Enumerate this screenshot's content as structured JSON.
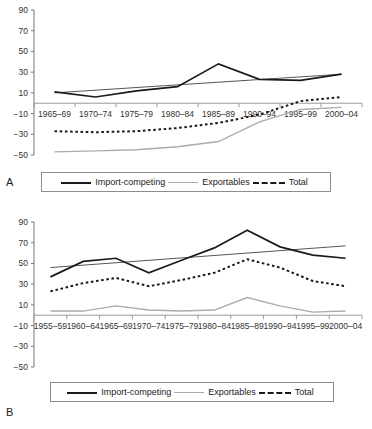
{
  "figure": {
    "panels": [
      {
        "letter": "A",
        "legend": [
          {
            "label": "Import-competing",
            "style": "solid-dark",
            "color": "#1a1a1a"
          },
          {
            "label": "Exportables",
            "style": "solid-light",
            "color": "#a8a8a8"
          },
          {
            "label": "Total",
            "style": "dotted",
            "color": "#1a1a1a"
          }
        ]
      },
      {
        "letter": "B",
        "legend": [
          {
            "label": "Import-competing",
            "style": "solid-dark",
            "color": "#1a1a1a"
          },
          {
            "label": "Exportables",
            "style": "solid-light",
            "color": "#a8a8a8"
          },
          {
            "label": "Total",
            "style": "dotted",
            "color": "#1a1a1a"
          }
        ]
      }
    ]
  },
  "chart_data": [
    {
      "type": "line",
      "panel": "A",
      "title": "",
      "xlabel": "",
      "ylabel": "",
      "ylim": [
        -50,
        90
      ],
      "yticks": [
        90,
        70,
        50,
        30,
        10,
        -10,
        -30,
        -50
      ],
      "ytick_labels": [
        "90",
        "70",
        "50",
        "30",
        "10",
        "−10",
        "−30",
        "−50"
      ],
      "grid": false,
      "legend_position": "bottom",
      "categories": [
        "1965–69",
        "1970–74",
        "1975–79",
        "1980–84",
        "1985–89",
        "1990–94",
        "1995–99",
        "2000–04"
      ],
      "series": [
        {
          "name": "Import-competing",
          "style": "solid-dark",
          "color": "#1a1a1a",
          "values": [
            11,
            6,
            12,
            16,
            38,
            23,
            22,
            28
          ]
        },
        {
          "name": "Exportables",
          "style": "solid-light",
          "color": "#a8a8a8",
          "values": [
            -47,
            -46,
            -45,
            -42,
            -37,
            -18,
            -6,
            -4
          ]
        },
        {
          "name": "Total",
          "style": "dotted",
          "color": "#1a1a1a",
          "values": [
            -27,
            -28,
            -27,
            -24,
            -19,
            -11,
            2,
            6
          ]
        }
      ],
      "trend_lines": [
        {
          "name": "Import-competing trend",
          "color": "#555555",
          "from": [
            0,
            10
          ],
          "to": [
            7,
            28
          ]
        }
      ]
    },
    {
      "type": "line",
      "panel": "B",
      "title": "",
      "xlabel": "",
      "ylabel": "",
      "ylim": [
        -50,
        90
      ],
      "yticks": [
        90,
        70,
        50,
        30,
        10,
        -10,
        -30,
        -50
      ],
      "ytick_labels": [
        "90",
        "70",
        "50",
        "30",
        "10",
        "−10",
        "−30",
        "−50"
      ],
      "grid": false,
      "legend_position": "bottom",
      "categories": [
        "1955–59",
        "1960–64",
        "1965–69",
        "1970–74",
        "1975–79",
        "1980–84",
        "1985–89",
        "1990–94",
        "1995–99",
        "2000–04"
      ],
      "series": [
        {
          "name": "Import-competing",
          "style": "solid-dark",
          "color": "#1a1a1a",
          "values": [
            37,
            52,
            55,
            41,
            53,
            65,
            82,
            66,
            58,
            55
          ]
        },
        {
          "name": "Exportables",
          "style": "solid-light",
          "color": "#a8a8a8",
          "values": [
            4,
            4,
            9,
            5,
            4,
            5,
            17,
            9,
            3,
            4
          ]
        },
        {
          "name": "Total",
          "style": "dotted",
          "color": "#1a1a1a",
          "values": [
            23,
            31,
            36,
            28,
            34,
            41,
            54,
            46,
            33,
            28
          ]
        }
      ],
      "trend_lines": [
        {
          "name": "Import-competing trend",
          "color": "#555555",
          "from": [
            0,
            46
          ],
          "to": [
            9,
            67
          ]
        }
      ]
    }
  ]
}
